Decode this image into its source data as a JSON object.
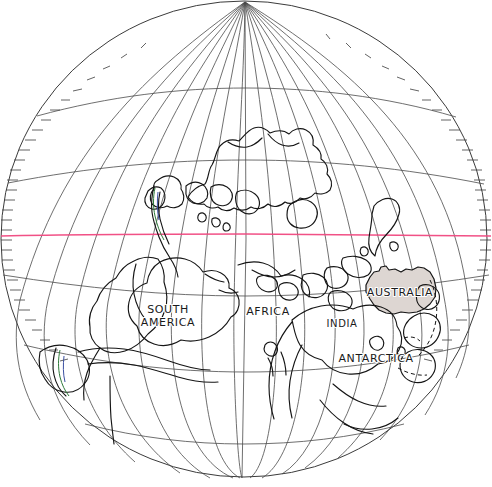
{
  "figure": {
    "kind": "paleogeographic-globe-map",
    "projection": "orthographic-style globe with graticule",
    "background_color": "#ffffff",
    "line_color": "#151515",
    "graticule_color": "#4a4a4a",
    "equator_color": "#f0487f",
    "highlight_fill": "#ddd6d2",
    "width": 492,
    "height": 487
  },
  "globe": {
    "center_x": 244,
    "center_y": 239,
    "radius_x": 243,
    "radius_y": 239,
    "north_pole": {
      "x": 245,
      "y": 2
    },
    "south_pole": {
      "x": 242,
      "y": 478
    },
    "meridian_count": 17,
    "parallel_count": 5,
    "limb_ticks": true
  },
  "lines": {
    "equator": {
      "name": "equator",
      "color": "#f0487f",
      "y": 235,
      "visible": true
    }
  },
  "labels": [
    {
      "id": "south-america",
      "text": "SOUTH",
      "text2": "AMERICA",
      "x": 168,
      "y": 312,
      "size": 11
    },
    {
      "id": "africa",
      "text": "AFRICA",
      "x": 268,
      "y": 313,
      "size": 11
    },
    {
      "id": "india",
      "text": "INDIA",
      "x": 342,
      "y": 326,
      "size": 10
    },
    {
      "id": "australia",
      "text": "AUSTRALIA",
      "x": 400,
      "y": 294,
      "size": 11
    },
    {
      "id": "antarctica",
      "text": "ANTARCTICA",
      "x": 376,
      "y": 361,
      "size": 11
    }
  ],
  "regions": [
    {
      "id": "australia-highlight",
      "label": "AUSTRALIA",
      "fill": "#ddd6d2",
      "shaded": true
    }
  ]
}
